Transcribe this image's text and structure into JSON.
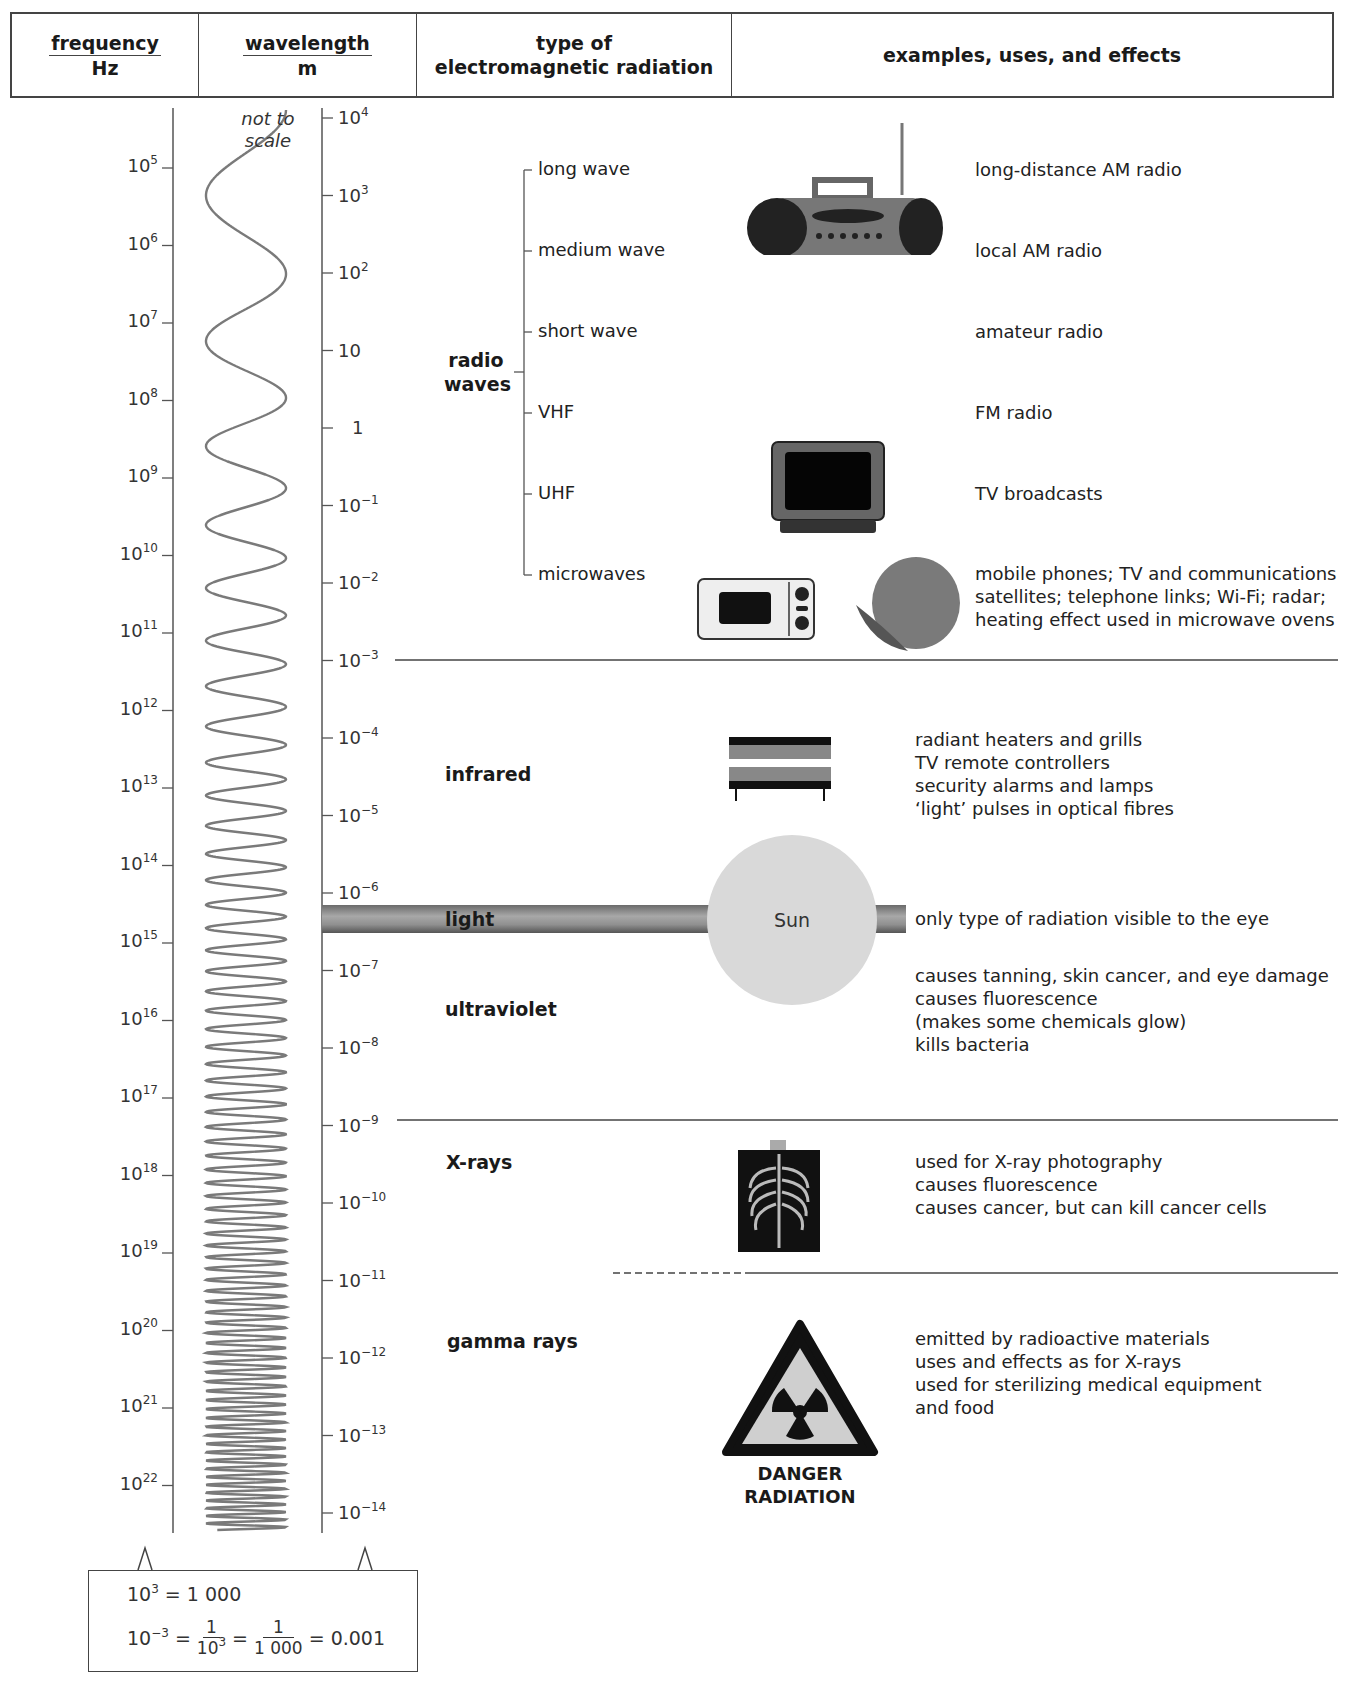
{
  "header": {
    "frequency": {
      "label": "frequency",
      "unit": "Hz"
    },
    "wavelength": {
      "label": "wavelength",
      "unit": "m"
    },
    "type": {
      "line1": "type of",
      "line2": "electromagnetic radiation"
    },
    "examples": "examples, uses, and effects"
  },
  "wave_note": {
    "line1": "not to",
    "line2": "scale"
  },
  "frequency_ticks": [
    {
      "base": "10",
      "exp": "5"
    },
    {
      "base": "10",
      "exp": "6"
    },
    {
      "base": "10",
      "exp": "7"
    },
    {
      "base": "10",
      "exp": "8"
    },
    {
      "base": "10",
      "exp": "9"
    },
    {
      "base": "10",
      "exp": "10"
    },
    {
      "base": "10",
      "exp": "11"
    },
    {
      "base": "10",
      "exp": "12"
    },
    {
      "base": "10",
      "exp": "13"
    },
    {
      "base": "10",
      "exp": "14"
    },
    {
      "base": "10",
      "exp": "15"
    },
    {
      "base": "10",
      "exp": "16"
    },
    {
      "base": "10",
      "exp": "17"
    },
    {
      "base": "10",
      "exp": "18"
    },
    {
      "base": "10",
      "exp": "19"
    },
    {
      "base": "10",
      "exp": "20"
    },
    {
      "base": "10",
      "exp": "21"
    },
    {
      "base": "10",
      "exp": "22"
    }
  ],
  "wavelength_ticks": [
    {
      "base": "10",
      "exp": "4"
    },
    {
      "base": "10",
      "exp": "3"
    },
    {
      "base": "10",
      "exp": "2"
    },
    {
      "base": "10",
      "exp": ""
    },
    {
      "base": "1",
      "exp": ""
    },
    {
      "base": "10",
      "exp": "−1"
    },
    {
      "base": "10",
      "exp": "−2"
    },
    {
      "base": "10",
      "exp": "−3"
    },
    {
      "base": "10",
      "exp": "−4"
    },
    {
      "base": "10",
      "exp": "−5"
    },
    {
      "base": "10",
      "exp": "−6"
    },
    {
      "base": "10",
      "exp": "−7"
    },
    {
      "base": "10",
      "exp": "−8"
    },
    {
      "base": "10",
      "exp": "−9"
    },
    {
      "base": "10",
      "exp": "−10"
    },
    {
      "base": "10",
      "exp": "−11"
    },
    {
      "base": "10",
      "exp": "−12"
    },
    {
      "base": "10",
      "exp": "−13"
    },
    {
      "base": "10",
      "exp": "−14"
    }
  ],
  "radio": {
    "label_line1": "radio",
    "label_line2": "waves",
    "subtypes": [
      {
        "name": "long wave",
        "use": "long-distance AM radio"
      },
      {
        "name": "medium wave",
        "use": "local AM radio"
      },
      {
        "name": "short wave",
        "use": "amateur radio"
      },
      {
        "name": "VHF",
        "use": "FM radio"
      },
      {
        "name": "UHF",
        "use": "TV broadcasts"
      },
      {
        "name": "microwaves",
        "use_lines": [
          "mobile phones; TV and communications",
          "satellites; telephone links; Wi-Fi; radar;",
          "heating effect used in microwave ovens"
        ]
      }
    ],
    "icons": [
      "radio-icon",
      "television-icon",
      "microwave-oven-icon",
      "satellite-dish-icon"
    ]
  },
  "infrared": {
    "label": "infrared",
    "uses": [
      "radiant heaters and grills",
      "TV remote controllers",
      "security alarms and lamps",
      "‘light’ pulses in optical fibres"
    ],
    "icon": "heater-icon"
  },
  "light": {
    "label": "light",
    "sun_label": "Sun",
    "uses": [
      "only type of radiation visible to the eye"
    ]
  },
  "ultraviolet": {
    "label": "ultraviolet",
    "uses": [
      "causes tanning, skin cancer, and eye damage",
      "causes fluorescence",
      "(makes some chemicals glow)",
      "kills bacteria"
    ]
  },
  "xrays": {
    "label": "X-rays",
    "uses": [
      "used for X-ray photography",
      "causes fluorescence",
      "causes cancer, but can kill cancer cells"
    ],
    "icon": "chest-xray-icon"
  },
  "gamma": {
    "label": "gamma rays",
    "uses": [
      "emitted by radioactive materials",
      "uses and effects as for X-rays",
      "used for sterilizing medical equipment",
      "and food"
    ],
    "sign_line1": "DANGER",
    "sign_line2": "RADIATION"
  },
  "note": {
    "line1_base": "10",
    "line1_exp": "3",
    "line1_rest": " = 1 000",
    "line2_base": "10",
    "line2_exp": "−3",
    "eq": "=",
    "frac1_num": "1",
    "frac1_den_base": "10",
    "frac1_den_exp": "3",
    "frac2_num": "1",
    "frac2_den": "1 000",
    "result": "= 0.001"
  },
  "colors": {
    "line": "#444444",
    "wave": "#7a7a7a",
    "sun": "#d9d9d9",
    "light_band": "#888888"
  }
}
